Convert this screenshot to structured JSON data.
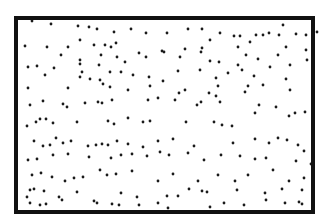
{
  "diagram": {
    "background": "#ffffff",
    "box": {
      "x": 16,
      "y": 18,
      "width": 297,
      "height": 194,
      "stroke": "#111111",
      "stroke_width": 4
    },
    "dot": {
      "radius": 1.4,
      "color": "#1a1a1a"
    },
    "points": [
      [
        32,
        21
      ],
      [
        51,
        24
      ],
      [
        78,
        26
      ],
      [
        89,
        27
      ],
      [
        97,
        29
      ],
      [
        114,
        32
      ],
      [
        131,
        29
      ],
      [
        146,
        33
      ],
      [
        167,
        33
      ],
      [
        188,
        29
      ],
      [
        202,
        29
      ],
      [
        220,
        33
      ],
      [
        234,
        36
      ],
      [
        240,
        36
      ],
      [
        256,
        35
      ],
      [
        269,
        33
      ],
      [
        279,
        35
      ],
      [
        283,
        25
      ],
      [
        296,
        34
      ],
      [
        306,
        35
      ],
      [
        317,
        32
      ],
      [
        25,
        46
      ],
      [
        47,
        47
      ],
      [
        68,
        47
      ],
      [
        80,
        40
      ],
      [
        94,
        45
      ],
      [
        105,
        45
      ],
      [
        111,
        47
      ],
      [
        116,
        43
      ],
      [
        139,
        53
      ],
      [
        162,
        51
      ],
      [
        185,
        49
      ],
      [
        202,
        48
      ],
      [
        210,
        40
      ],
      [
        238,
        47
      ],
      [
        250,
        42
      ],
      [
        263,
        35
      ],
      [
        286,
        47
      ],
      [
        306,
        50
      ],
      [
        61,
        55
      ],
      [
        80,
        60
      ],
      [
        80,
        64
      ],
      [
        101,
        55
      ],
      [
        117,
        57
      ],
      [
        125,
        62
      ],
      [
        146,
        57
      ],
      [
        164,
        52
      ],
      [
        180,
        57
      ],
      [
        201,
        52
      ],
      [
        210,
        61
      ],
      [
        219,
        62
      ],
      [
        238,
        65
      ],
      [
        246,
        55
      ],
      [
        258,
        59
      ],
      [
        278,
        55
      ],
      [
        290,
        65
      ],
      [
        307,
        60
      ],
      [
        28,
        67
      ],
      [
        37,
        66
      ],
      [
        45,
        75
      ],
      [
        54,
        68
      ],
      [
        82,
        72
      ],
      [
        99,
        65
      ],
      [
        100,
        80
      ],
      [
        110,
        72
      ],
      [
        121,
        72
      ],
      [
        133,
        75
      ],
      [
        149,
        77
      ],
      [
        178,
        71
      ],
      [
        200,
        70
      ],
      [
        216,
        78
      ],
      [
        228,
        73
      ],
      [
        242,
        70
      ],
      [
        254,
        76
      ],
      [
        270,
        67
      ],
      [
        286,
        79
      ],
      [
        28,
        88
      ],
      [
        68,
        88
      ],
      [
        80,
        77
      ],
      [
        90,
        79
      ],
      [
        103,
        84
      ],
      [
        110,
        87
      ],
      [
        128,
        90
      ],
      [
        150,
        86
      ],
      [
        163,
        81
      ],
      [
        179,
        93
      ],
      [
        218,
        86
      ],
      [
        216,
        96
      ],
      [
        248,
        86
      ],
      [
        263,
        85
      ],
      [
        290,
        90
      ],
      [
        30,
        105
      ],
      [
        43,
        101
      ],
      [
        63,
        104
      ],
      [
        67,
        107
      ],
      [
        85,
        103
      ],
      [
        98,
        102
      ],
      [
        102,
        103
      ],
      [
        112,
        100
      ],
      [
        148,
        100
      ],
      [
        158,
        98
      ],
      [
        185,
        90
      ],
      [
        201,
        102
      ],
      [
        209,
        93
      ],
      [
        220,
        102
      ],
      [
        245,
        92
      ],
      [
        255,
        113
      ],
      [
        276,
        107
      ],
      [
        295,
        113
      ],
      [
        27,
        126
      ],
      [
        36,
        122
      ],
      [
        40,
        119
      ],
      [
        46,
        119
      ],
      [
        53,
        123
      ],
      [
        77,
        122
      ],
      [
        108,
        121
      ],
      [
        114,
        124
      ],
      [
        128,
        118
      ],
      [
        143,
        122
      ],
      [
        150,
        121
      ],
      [
        175,
        100
      ],
      [
        186,
        122
      ],
      [
        197,
        105
      ],
      [
        214,
        122
      ],
      [
        222,
        125
      ],
      [
        232,
        126
      ],
      [
        259,
        105
      ],
      [
        289,
        116
      ],
      [
        305,
        112
      ],
      [
        34,
        141
      ],
      [
        43,
        146
      ],
      [
        50,
        145
      ],
      [
        56,
        138
      ],
      [
        63,
        143
      ],
      [
        71,
        141
      ],
      [
        88,
        146
      ],
      [
        96,
        145
      ],
      [
        102,
        144
      ],
      [
        108,
        145
      ],
      [
        117,
        141
      ],
      [
        128,
        144
      ],
      [
        143,
        147
      ],
      [
        158,
        141
      ],
      [
        173,
        139
      ],
      [
        194,
        146
      ],
      [
        233,
        143
      ],
      [
        255,
        139
      ],
      [
        269,
        143
      ],
      [
        278,
        138
      ],
      [
        287,
        140
      ],
      [
        298,
        145
      ],
      [
        28,
        160
      ],
      [
        37,
        159
      ],
      [
        53,
        155
      ],
      [
        68,
        154
      ],
      [
        89,
        157
      ],
      [
        111,
        158
      ],
      [
        121,
        155
      ],
      [
        132,
        154
      ],
      [
        147,
        156
      ],
      [
        160,
        152
      ],
      [
        169,
        155
      ],
      [
        188,
        153
      ],
      [
        204,
        160
      ],
      [
        221,
        155
      ],
      [
        240,
        156
      ],
      [
        255,
        159
      ],
      [
        266,
        158
      ],
      [
        296,
        161
      ],
      [
        304,
        151
      ],
      [
        32,
        175
      ],
      [
        41,
        173
      ],
      [
        52,
        177
      ],
      [
        65,
        181
      ],
      [
        74,
        178
      ],
      [
        83,
        177
      ],
      [
        100,
        170
      ],
      [
        107,
        175
      ],
      [
        116,
        174
      ],
      [
        132,
        171
      ],
      [
        158,
        181
      ],
      [
        173,
        174
      ],
      [
        198,
        181
      ],
      [
        218,
        175
      ],
      [
        235,
        181
      ],
      [
        248,
        175
      ],
      [
        273,
        170
      ],
      [
        289,
        181
      ],
      [
        304,
        178
      ],
      [
        311,
        164
      ],
      [
        27,
        197
      ],
      [
        30,
        190
      ],
      [
        34,
        189
      ],
      [
        44,
        191
      ],
      [
        59,
        197
      ],
      [
        77,
        192
      ],
      [
        94,
        201
      ],
      [
        121,
        193
      ],
      [
        137,
        197
      ],
      [
        167,
        196
      ],
      [
        178,
        196
      ],
      [
        189,
        189
      ],
      [
        202,
        191
      ],
      [
        207,
        192
      ],
      [
        237,
        190
      ],
      [
        265,
        193
      ],
      [
        282,
        189
      ],
      [
        302,
        190
      ],
      [
        30,
        203
      ],
      [
        40,
        205
      ],
      [
        46,
        204
      ],
      [
        62,
        200
      ],
      [
        97,
        203
      ],
      [
        112,
        204
      ],
      [
        119,
        205
      ],
      [
        139,
        205
      ],
      [
        158,
        203
      ],
      [
        168,
        208
      ],
      [
        210,
        207
      ],
      [
        224,
        203
      ],
      [
        244,
        205
      ],
      [
        266,
        200
      ],
      [
        285,
        203
      ],
      [
        299,
        202
      ],
      [
        302,
        204
      ]
    ]
  }
}
